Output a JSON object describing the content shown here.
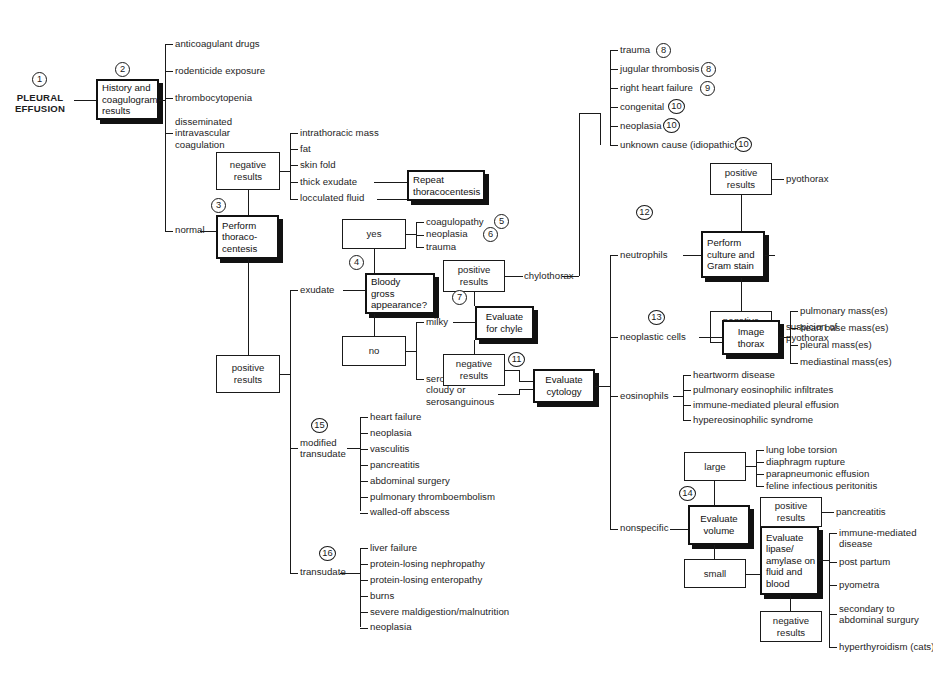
{
  "diagram": {
    "root": "PLEURAL\nEFFUSION",
    "steps": [
      "1",
      "2",
      "3",
      "4",
      "5",
      "6",
      "7",
      "8",
      "9",
      "10",
      "11",
      "12",
      "13",
      "14",
      "15",
      "16"
    ]
  },
  "nodes": {
    "history": "History and\ncoagulogram\nresults",
    "negative_results_1": "negative\nresults",
    "repeat_thoracocentesis": "Repeat\nthoracocentesis",
    "perform_thoracocentesis": "Perform\nthoraco-\ncentesis",
    "positive_results_1": "positive\nresults",
    "yes": "yes",
    "no": "no",
    "bloody": "Bloody\ngross\nappearance?",
    "positive_results_chyle": "positive\nresults",
    "evaluate_chyle": "Evaluate\nfor chyle",
    "negative_results_chyle": "negative\nresults",
    "evaluate_cytology": "Evaluate\ncytology",
    "positive_results_culture": "positive\nresults",
    "perform_culture": "Perform\nculture and\nGram stain",
    "negative_results_culture": "negative\nresults",
    "image_thorax": "Image\nthorax",
    "large": "large",
    "small": "small",
    "evaluate_volume": "Evaluate\nvolume",
    "evaluate_lipase": "Evaluate\nlipase/\namylase on\nfluid and\nblood",
    "positive_results_lipase": "positive\nresults",
    "negative_results_lipase": "negative\nresults"
  },
  "branches": {
    "coagulogram_causes": [
      "anticoagulant drugs",
      "rodenticide exposure",
      "thrombocytopenia",
      "disseminated\nintravascular\ncoagulation"
    ],
    "normal": "normal",
    "negative_results_causes": [
      "intrathoracic mass",
      "fat",
      "skin fold",
      "thick exudate",
      "locculated fluid"
    ],
    "bloody_yes_causes": [
      "coagulopathy",
      "neoplasia",
      "trauma"
    ],
    "fluid_types": [
      "exudate",
      "modified\ntransudate",
      "transudate"
    ],
    "gross_appearance": [
      "milky",
      "serous,\ncloudy or\nserosanguinous"
    ],
    "chylothorax": "chylothorax",
    "chylous_causes": [
      "trauma",
      "jugular thrombosis",
      "right heart failure",
      "congenital",
      "neoplasia",
      "unknown cause (idiopathic)"
    ],
    "cytology_results": [
      "neutrophils",
      "neoplastic cells",
      "eosinophils",
      "nonspecific"
    ],
    "pyothorax": "pyothorax",
    "suspicion_pyothorax": "suspicion of\npyothorax",
    "thorax_masses": [
      "pulmonary mass(es)",
      "heart base mass(es)",
      "pleural mass(es)",
      "mediastinal mass(es)"
    ],
    "eosinophil_causes": [
      "heartworm disease",
      "pulmonary eosinophilic infiltrates",
      "immune-mediated pleural effusion",
      "hypereosinophilic syndrome"
    ],
    "large_volume_causes": [
      "lung lobe torsion",
      "diaphragm rupture",
      "parapneumonic effusion",
      "feline infectious peritonitis"
    ],
    "pancreatitis": "pancreatitis",
    "lipase_negative_causes": [
      "immune-mediated\ndisease",
      "post partum",
      "pyometra",
      "secondary to\nabdominal surgury",
      "hyperthyroidism (cats)"
    ],
    "modified_transudate_causes": [
      "heart failure",
      "neoplasia",
      "vasculitis",
      "pancreatitis",
      "abdominal surgery",
      "pulmonary thromboembolism",
      "walled-off abscess"
    ],
    "transudate_causes": [
      "liver failure",
      "protein-losing nephropathy",
      "protein-losing enteropathy",
      "burns",
      "severe maldigestion/malnutrition",
      "neoplasia"
    ]
  },
  "colors": {
    "line": "#1a1a1a",
    "heavy": "#111111",
    "background": "#ffffff"
  }
}
